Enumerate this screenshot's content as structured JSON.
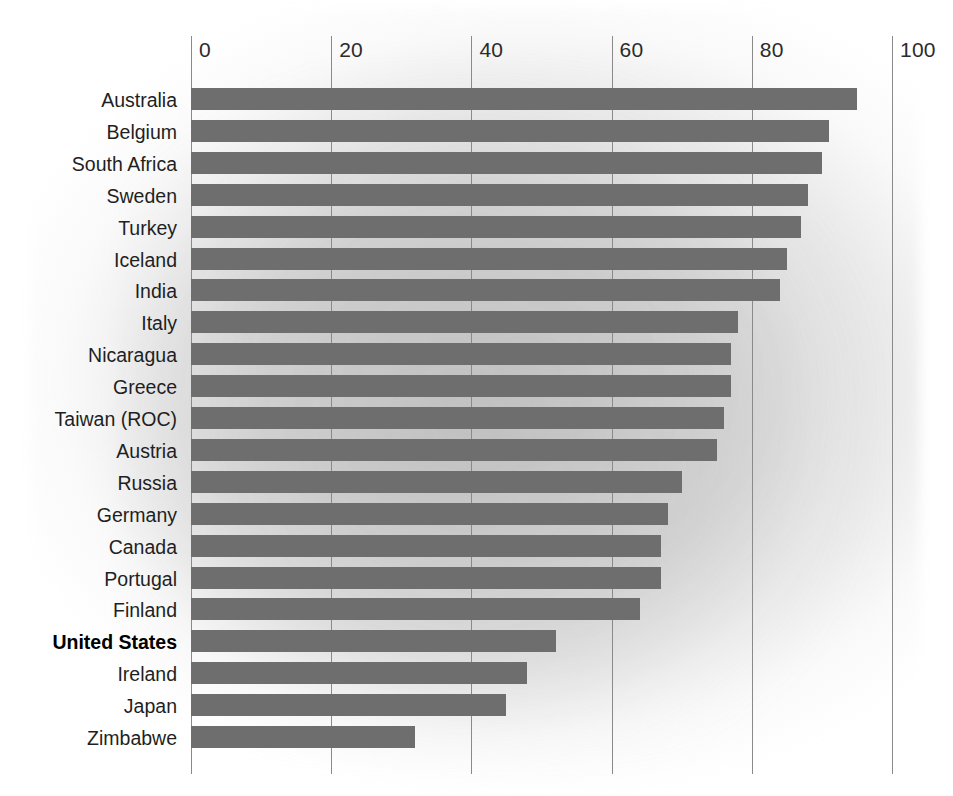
{
  "chart_data": {
    "type": "bar",
    "orientation": "horizontal",
    "title": "",
    "subtitle": "",
    "xlabel": "",
    "ylabel": "",
    "xlim": [
      0,
      100
    ],
    "ylim": null,
    "grid": true,
    "legend": null,
    "xticks": [
      "0",
      "20",
      "40",
      "60",
      "80",
      "100"
    ],
    "xtick_values": [
      0,
      20,
      40,
      60,
      80,
      100
    ],
    "categories": [
      "Australia",
      "Belgium",
      "South Africa",
      "Sweden",
      "Turkey",
      "Iceland",
      "India",
      "Italy",
      "Nicaragua",
      "Greece",
      "Taiwan (ROC)",
      "Austria",
      "Russia",
      "Germany",
      "Canada",
      "Portugal",
      "Finland",
      "United States",
      "Ireland",
      "Japan",
      "Zimbabwe"
    ],
    "values": [
      95,
      91,
      90,
      88,
      87,
      85,
      84,
      78,
      77,
      77,
      76,
      75,
      70,
      68,
      67,
      67,
      64,
      52,
      48,
      45,
      32
    ],
    "highlight_category": "United States",
    "bar_color": "#6e6e6e",
    "gridline_color": "#8a8a8a",
    "background_color": "#ffffff",
    "label_color": "#1f1f1f"
  }
}
